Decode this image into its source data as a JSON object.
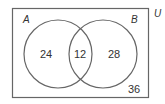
{
  "diagram": {
    "type": "venn",
    "universe_label": "U",
    "sets": [
      {
        "label": "A",
        "only_value": "24"
      },
      {
        "label": "B",
        "only_value": "28"
      }
    ],
    "intersection_value": "12",
    "outside_value": "36",
    "colors": {
      "stroke": "#666666",
      "text": "#333333"
    }
  }
}
